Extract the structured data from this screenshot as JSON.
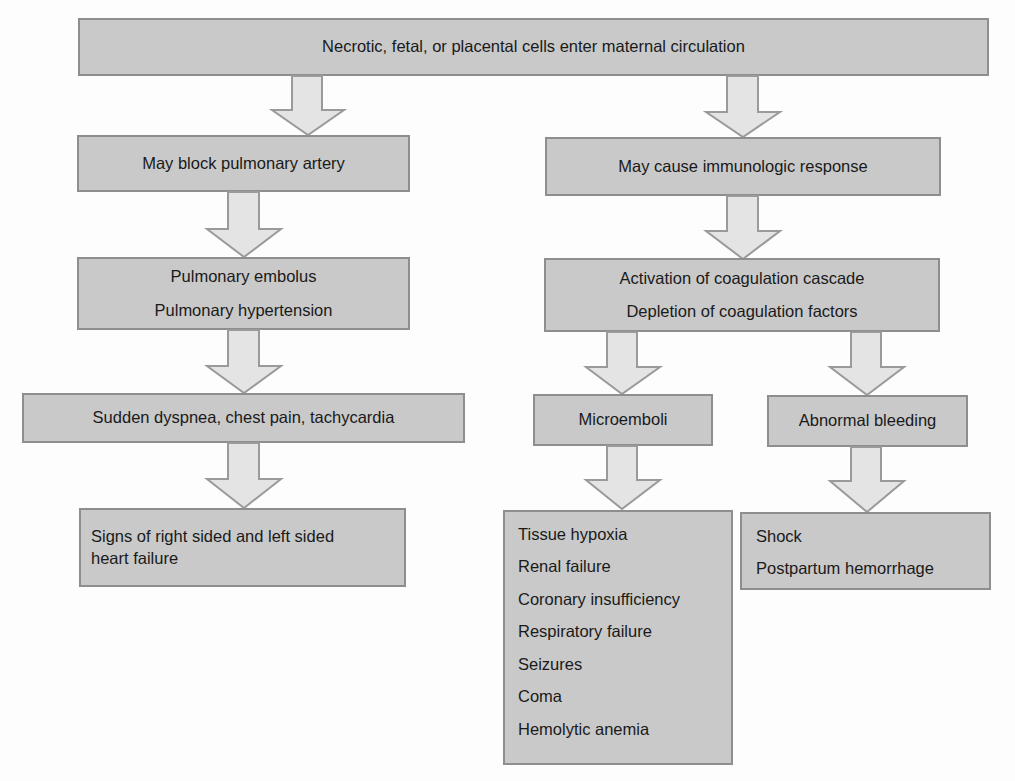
{
  "diagram": {
    "type": "flowchart",
    "root": {
      "label": "Necrotic, fetal, or placental cells enter maternal circulation"
    },
    "left_branch": {
      "step1": "May block pulmonary artery",
      "step2": [
        "Pulmonary embolus",
        "Pulmonary hypertension"
      ],
      "step3": "Sudden dyspnea, chest pain, tachycardia",
      "step4": [
        "Signs of right sided and left sided",
        "heart failure"
      ]
    },
    "right_branch": {
      "step1": "May cause immunologic response",
      "step2": [
        "Activation of coagulation cascade",
        "Depletion of coagulation factors"
      ],
      "sub_left": {
        "label": "Microemboli",
        "outcomes": [
          "Tissue hypoxia",
          "Renal failure",
          "Coronary insufficiency",
          "Respiratory failure",
          "Seizures",
          "Coma",
          "Hemolytic anemia"
        ]
      },
      "sub_right": {
        "label": "Abnormal bleeding",
        "outcomes": [
          "Shock",
          "Postpartum hemorrhage"
        ]
      }
    },
    "colors": {
      "box_fill": "#c9c9c9",
      "box_border": "#8e8e8e",
      "arrow_fill": "#e4e4e4",
      "arrow_stroke": "#9a9a9a",
      "background": "#fdfdfd"
    }
  }
}
